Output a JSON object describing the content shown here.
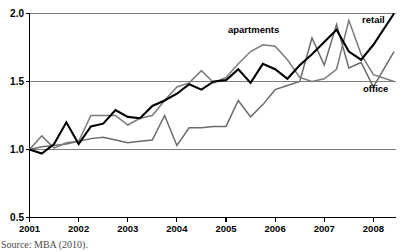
{
  "chart_data": {
    "type": "line",
    "title": "",
    "xlabel": "",
    "ylabel": "",
    "xlim": [
      2001,
      2008.45
    ],
    "ylim": [
      0.5,
      2.0
    ],
    "yticks": [
      "0.5",
      "1.0",
      "1.5",
      "2.0"
    ],
    "ytick_values": [
      0.5,
      1.0,
      1.5,
      2.0
    ],
    "xticks": [
      "2001",
      "2002",
      "2003",
      "2004",
      "2005",
      "2006",
      "2007",
      "2008"
    ],
    "xtick_values": [
      2001,
      2002,
      2003,
      2004,
      2005,
      2006,
      2007,
      2008
    ],
    "grid": "horizontal",
    "legend_position": "inline-annotations",
    "series": [
      {
        "name": "retail",
        "color": "#000000",
        "width": 2.1,
        "label": "retail",
        "x": [
          2001.0,
          2001.25,
          2001.5,
          2001.75,
          2002.0,
          2002.25,
          2002.5,
          2002.75,
          2003.0,
          2003.25,
          2003.5,
          2003.75,
          2004.0,
          2004.25,
          2004.5,
          2004.75,
          2005.0,
          2005.25,
          2005.5,
          2005.75,
          2006.0,
          2006.25,
          2006.5,
          2006.75,
          2007.0,
          2007.25,
          2007.5,
          2007.75,
          2008.0,
          2008.42
        ],
        "y": [
          1.0,
          0.97,
          1.04,
          1.2,
          1.04,
          1.17,
          1.19,
          1.29,
          1.24,
          1.23,
          1.32,
          1.36,
          1.41,
          1.48,
          1.44,
          1.5,
          1.51,
          1.59,
          1.49,
          1.63,
          1.59,
          1.52,
          1.62,
          1.7,
          1.79,
          1.88,
          1.72,
          1.66,
          1.77,
          2.0
        ]
      },
      {
        "name": "apartments",
        "color": "#7a7a7a",
        "width": 1.5,
        "label": "apartments",
        "x": [
          2001.0,
          2001.25,
          2001.5,
          2001.75,
          2002.0,
          2002.25,
          2002.5,
          2002.75,
          2003.0,
          2003.25,
          2003.5,
          2003.75,
          2004.0,
          2004.25,
          2004.5,
          2004.75,
          2005.0,
          2005.25,
          2005.5,
          2005.75,
          2006.0,
          2006.25,
          2006.5,
          2006.75,
          2007.0,
          2007.25,
          2007.5,
          2007.75,
          2008.0,
          2008.42
        ],
        "y": [
          1.0,
          1.1,
          1.01,
          1.05,
          1.06,
          1.25,
          1.25,
          1.25,
          1.18,
          1.23,
          1.25,
          1.36,
          1.46,
          1.49,
          1.58,
          1.49,
          1.53,
          1.63,
          1.72,
          1.77,
          1.76,
          1.66,
          1.53,
          1.5,
          1.52,
          1.59,
          1.95,
          1.7,
          1.55,
          1.5
        ]
      },
      {
        "name": "office",
        "color": "#6b6b6b",
        "width": 1.5,
        "label": "office",
        "x": [
          2001.0,
          2001.25,
          2001.5,
          2001.75,
          2002.0,
          2002.25,
          2002.5,
          2002.75,
          2003.0,
          2003.25,
          2003.5,
          2003.75,
          2004.0,
          2004.25,
          2004.5,
          2004.75,
          2005.0,
          2005.25,
          2005.5,
          2005.75,
          2006.0,
          2006.25,
          2006.5,
          2006.75,
          2007.0,
          2007.25,
          2007.5,
          2007.75,
          2008.0,
          2008.42
        ],
        "y": [
          1.0,
          1.02,
          1.03,
          1.04,
          1.06,
          1.08,
          1.09,
          1.07,
          1.05,
          1.06,
          1.07,
          1.25,
          1.03,
          1.16,
          1.16,
          1.17,
          1.17,
          1.36,
          1.24,
          1.33,
          1.44,
          1.47,
          1.5,
          1.82,
          1.62,
          1.92,
          1.6,
          1.64,
          1.46,
          1.72
        ]
      }
    ],
    "annotations": [
      {
        "text": "apartments",
        "series": "apartments"
      },
      {
        "text": "retail",
        "series": "retail"
      },
      {
        "text": "office",
        "series": "office"
      }
    ]
  },
  "source_note": "Source: MBA (2010).",
  "axis": {
    "y_label_2_0": "2.0",
    "y_label_1_5": "1.5",
    "y_label_1_0": "1.0",
    "y_label_0_5": "0.5"
  },
  "colors": {
    "retail": "#000000",
    "apartments": "#7a7a7a",
    "office": "#6b6b6b",
    "axis": "#000000",
    "gridline": "#7d7d7d",
    "background": "#ffffff"
  }
}
